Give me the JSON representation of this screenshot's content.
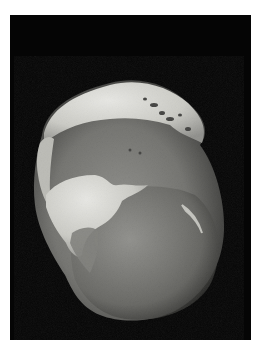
{
  "image": {
    "subject": "flint nodule stone on black background",
    "background_color": "#050505",
    "border_color": "#ffffff",
    "stone_colors": {
      "cortex_light": "#d8d8d4",
      "cortex_mid": "#b8b8b2",
      "flint_dark": "#6a6a66",
      "flint_mid": "#808080",
      "shadow": "#2a2a2a"
    }
  }
}
